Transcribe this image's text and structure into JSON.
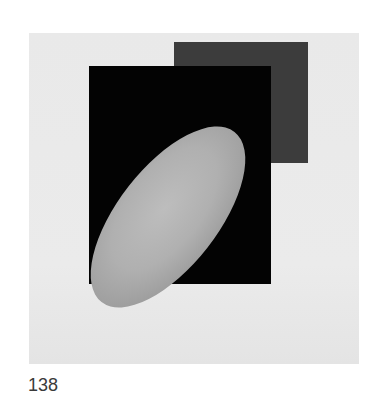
{
  "artwork": {
    "background_color": "#e9e9e9",
    "shapes": [
      {
        "name": "gray-square",
        "color": "#3c3c3c"
      },
      {
        "name": "black-rectangle",
        "color": "#030303"
      },
      {
        "name": "gray-ellipse",
        "color": "#b0b0b0"
      }
    ]
  },
  "caption": {
    "plate_number": "138"
  }
}
